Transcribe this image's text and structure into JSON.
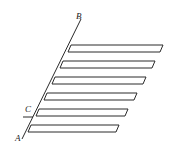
{
  "diagram": {
    "type": "geometry-figure",
    "labels": {
      "A": "A",
      "B": "B",
      "C": "C"
    },
    "stroke_color": "#2a2a2a",
    "background": "#ffffff",
    "bar_count": 6
  }
}
